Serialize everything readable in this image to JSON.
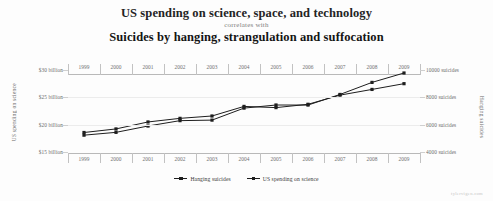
{
  "titles": {
    "line1": "US spending on science, space, and technology",
    "connector": "correlates with",
    "line2": "Suicides by hanging, strangulation and suffocation"
  },
  "axis_titles": {
    "left": "US spending on science",
    "right": "Hanging suicides"
  },
  "legend": [
    {
      "label": "Hanging suicides",
      "color": "#1e1e1e"
    },
    {
      "label": "US spending on science",
      "color": "#1e1e1e"
    }
  ],
  "watermark": "tylervigen.com",
  "chart_data": {
    "type": "line",
    "title": "US spending on science, space, and technology correlates with Suicides by hanging, strangulation and suffocation",
    "subtitle": "correlates with",
    "xlabel": "",
    "ylabel": "US spending on science",
    "y2label": "Hanging suicides",
    "grid": true,
    "legend_position": "bottom",
    "x": [
      1999,
      2000,
      2001,
      2002,
      2003,
      2004,
      2005,
      2006,
      2007,
      2008,
      2009
    ],
    "x_axis_top": true,
    "x_axis_bottom": true,
    "xticklabels": [
      "1999",
      "2000",
      "2001",
      "2002",
      "2003",
      "2004",
      "2005",
      "2006",
      "2007",
      "2008",
      "2009"
    ],
    "ylim": [
      15,
      30
    ],
    "yticks": [
      15,
      20,
      25,
      30
    ],
    "yticklabels": [
      "$15 billion",
      "$20 billion",
      "$25 billion",
      "$30 billion"
    ],
    "y2lim": [
      4000,
      10000
    ],
    "y2ticks": [
      4000,
      6000,
      8000,
      10000
    ],
    "y2ticklabels": [
      "4000 suicides",
      "6000 suicides",
      "8000 suicides",
      "10000 suicides"
    ],
    "series": [
      {
        "name": "US spending on science",
        "axis": "left",
        "unit": "billion USD",
        "values": [
          18.079,
          18.594,
          19.753,
          20.734,
          20.831,
          23.029,
          23.597,
          23.584,
          25.525,
          27.731,
          29.449
        ]
      },
      {
        "name": "Hanging suicides",
        "axis": "right",
        "unit": "suicides",
        "values": [
          5427,
          5688,
          6198,
          6462,
          6635,
          7336,
          7248,
          7491,
          8161,
          8578,
          9000
        ]
      }
    ],
    "correlation": 0.992
  }
}
